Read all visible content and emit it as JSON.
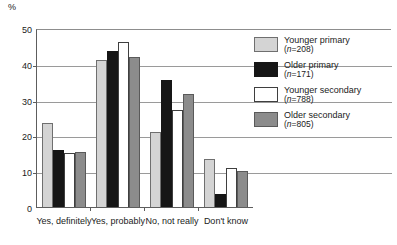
{
  "chart_data": {
    "type": "bar",
    "title": "",
    "subtitle": "",
    "xlabel": "",
    "ylabel": "%",
    "ylim": [
      0,
      50
    ],
    "yticks": [
      0,
      10,
      20,
      30,
      40,
      50
    ],
    "grid": true,
    "legend_position": "right",
    "categories": [
      "Yes, definitely",
      "Yes, probably",
      "No, not really",
      "Don't know"
    ],
    "series": [
      {
        "name": "Younger primary",
        "n": "(n=208)",
        "color": "#d4d4d4",
        "values": [
          23.5,
          41.0,
          21.0,
          13.5
        ]
      },
      {
        "name": "Older primary",
        "n": "(n=171)",
        "color": "#161616",
        "values": [
          16.0,
          43.5,
          35.5,
          3.5
        ]
      },
      {
        "name": "Younger secondary",
        "n": "(n=788)",
        "color": "#ffffff",
        "values": [
          15.0,
          46.0,
          27.0,
          11.0
        ]
      },
      {
        "name": "Older secondary",
        "n": "(n=805)",
        "color": "#8c8c8c",
        "values": [
          15.5,
          42.0,
          31.5,
          10.0
        ]
      }
    ]
  }
}
